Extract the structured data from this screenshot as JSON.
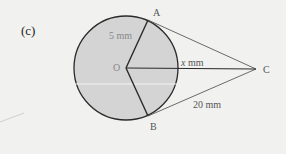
{
  "diagram": {
    "part_label": "(c)",
    "points": {
      "O": {
        "label": "O",
        "x": 126,
        "y": 68
      },
      "A": {
        "label": "A",
        "x": 148,
        "y": 19
      },
      "B": {
        "label": "B",
        "x": 148,
        "y": 117
      },
      "C": {
        "label": "C",
        "x": 256,
        "y": 69
      }
    },
    "circle": {
      "center": "O",
      "radius_px": 52,
      "fill": "#d4d4d4",
      "stroke": "#2a2a2a"
    },
    "labels": {
      "radius": "5 mm",
      "oc_var": "x",
      "oc_unit": "mm",
      "tangent_length": "20 mm"
    },
    "segments": [
      {
        "from": "O",
        "to": "A",
        "type": "radius"
      },
      {
        "from": "O",
        "to": "B",
        "type": "radius"
      },
      {
        "from": "O",
        "to": "C",
        "type": "line"
      },
      {
        "from": "A",
        "to": "C",
        "type": "tangent"
      },
      {
        "from": "B",
        "to": "C",
        "type": "tangent"
      }
    ],
    "colors": {
      "background": "#f1f1f0",
      "circle_fill": "#d4d4d4",
      "line_dark": "#2a2a2a",
      "tangent_line": "#6a6a6a",
      "text": "#444444"
    }
  }
}
